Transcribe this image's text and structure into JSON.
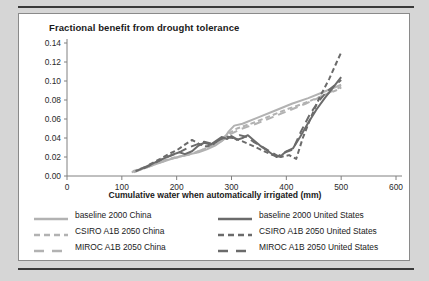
{
  "figure": {
    "title": "Fractional benefit from drought tolerance",
    "xlabel": "Cumulative water when automatically irrigated (mm)"
  },
  "colors": {
    "china": "#b2b2b2",
    "united_states": "#6b6b6b",
    "axis": "#808080",
    "text": "#1a1a1a",
    "page_background": "#d6d6d6",
    "card_background": "#ffffff",
    "rule": "#3a3a3a"
  },
  "legend": {
    "position": "below-axis",
    "items": [
      {
        "label": "baseline 2000 China",
        "color": "#b2b2b2",
        "style": "solid",
        "region": "China"
      },
      {
        "label": "baseline 2000 United States",
        "color": "#6b6b6b",
        "style": "solid",
        "region": "United States"
      },
      {
        "label": "CSIRO A1B 2050 China",
        "color": "#b2b2b2",
        "style": "dashed",
        "region": "China"
      },
      {
        "label": "CSIRO A1B 2050 United States",
        "color": "#6b6b6b",
        "style": "dashed",
        "region": "United States"
      },
      {
        "label": "MIROC A1B 2050 China",
        "color": "#b2b2b2",
        "style": "long-dash",
        "region": "China"
      },
      {
        "label": "MIROC A1B 2050 United States",
        "color": "#6b6b6b",
        "style": "long-dash",
        "region": "United States"
      }
    ]
  },
  "chart_data": {
    "type": "line",
    "title": "Fractional benefit from drought tolerance",
    "xlabel": "Cumulative water when automatically irrigated (mm)",
    "ylabel": "",
    "xlim": [
      0,
      600
    ],
    "ylim": [
      0.0,
      0.14
    ],
    "xticks": [
      0,
      100,
      200,
      300,
      400,
      500,
      600
    ],
    "yticks": [
      "0.00",
      "0.02",
      "0.04",
      "0.06",
      "0.08",
      "0.10",
      "0.12",
      "0.14"
    ],
    "grid": false,
    "legend_position": "bottom",
    "series": [
      {
        "name": "baseline 2000 China",
        "color": "#b2b2b2",
        "style": "solid",
        "points": [
          [
            118,
            0.004
          ],
          [
            135,
            0.007
          ],
          [
            150,
            0.01
          ],
          [
            165,
            0.013
          ],
          [
            180,
            0.016
          ],
          [
            195,
            0.019
          ],
          [
            210,
            0.021
          ],
          [
            225,
            0.023
          ],
          [
            240,
            0.025
          ],
          [
            255,
            0.028
          ],
          [
            270,
            0.032
          ],
          [
            285,
            0.038
          ],
          [
            295,
            0.047
          ],
          [
            305,
            0.053
          ],
          [
            320,
            0.055
          ],
          [
            350,
            0.062
          ],
          [
            380,
            0.069
          ],
          [
            410,
            0.076
          ],
          [
            440,
            0.082
          ],
          [
            470,
            0.089
          ],
          [
            500,
            0.096
          ]
        ]
      },
      {
        "name": "CSIRO A1B 2050 China",
        "color": "#b2b2b2",
        "style": "dashed",
        "points": [
          [
            120,
            0.005
          ],
          [
            140,
            0.009
          ],
          [
            160,
            0.013
          ],
          [
            180,
            0.017
          ],
          [
            200,
            0.02
          ],
          [
            220,
            0.022
          ],
          [
            240,
            0.026
          ],
          [
            260,
            0.031
          ],
          [
            280,
            0.038
          ],
          [
            295,
            0.045
          ],
          [
            310,
            0.05
          ],
          [
            340,
            0.056
          ],
          [
            370,
            0.063
          ],
          [
            400,
            0.07
          ],
          [
            430,
            0.076
          ],
          [
            460,
            0.083
          ],
          [
            490,
            0.09
          ],
          [
            500,
            0.093
          ]
        ]
      },
      {
        "name": "MIROC A1B 2050 China",
        "color": "#b2b2b2",
        "style": "long-dash",
        "points": [
          [
            122,
            0.004
          ],
          [
            145,
            0.009
          ],
          [
            168,
            0.014
          ],
          [
            190,
            0.018
          ],
          [
            212,
            0.021
          ],
          [
            235,
            0.025
          ],
          [
            258,
            0.03
          ],
          [
            280,
            0.036
          ],
          [
            298,
            0.044
          ],
          [
            315,
            0.049
          ],
          [
            345,
            0.055
          ],
          [
            375,
            0.062
          ],
          [
            405,
            0.069
          ],
          [
            435,
            0.076
          ],
          [
            465,
            0.084
          ],
          [
            500,
            0.094
          ]
        ]
      },
      {
        "name": "baseline 2000 United States",
        "color": "#6b6b6b",
        "style": "solid",
        "points": [
          [
            125,
            0.005
          ],
          [
            145,
            0.01
          ],
          [
            160,
            0.014
          ],
          [
            175,
            0.018
          ],
          [
            190,
            0.022
          ],
          [
            205,
            0.025
          ],
          [
            215,
            0.023
          ],
          [
            228,
            0.026
          ],
          [
            240,
            0.032
          ],
          [
            250,
            0.035
          ],
          [
            262,
            0.033
          ],
          [
            272,
            0.037
          ],
          [
            282,
            0.041
          ],
          [
            292,
            0.039
          ],
          [
            300,
            0.042
          ],
          [
            310,
            0.038
          ],
          [
            320,
            0.04
          ],
          [
            330,
            0.043
          ],
          [
            340,
            0.038
          ],
          [
            352,
            0.032
          ],
          [
            362,
            0.028
          ],
          [
            372,
            0.024
          ],
          [
            382,
            0.02
          ],
          [
            392,
            0.022
          ],
          [
            400,
            0.026
          ],
          [
            412,
            0.029
          ],
          [
            425,
            0.041
          ],
          [
            440,
            0.056
          ],
          [
            455,
            0.07
          ],
          [
            470,
            0.082
          ],
          [
            485,
            0.093
          ],
          [
            500,
            0.104
          ]
        ]
      },
      {
        "name": "CSIRO A1B 2050 United States",
        "color": "#6b6b6b",
        "style": "dashed",
        "points": [
          [
            150,
            0.012
          ],
          [
            170,
            0.018
          ],
          [
            185,
            0.023
          ],
          [
            200,
            0.027
          ],
          [
            215,
            0.033
          ],
          [
            228,
            0.038
          ],
          [
            240,
            0.034
          ],
          [
            255,
            0.031
          ],
          [
            268,
            0.034
          ],
          [
            280,
            0.039
          ],
          [
            292,
            0.041
          ],
          [
            305,
            0.04
          ],
          [
            318,
            0.037
          ],
          [
            330,
            0.034
          ],
          [
            345,
            0.03
          ],
          [
            360,
            0.026
          ],
          [
            375,
            0.022
          ],
          [
            390,
            0.02
          ],
          [
            405,
            0.022
          ],
          [
            418,
            0.018
          ],
          [
            430,
            0.04
          ],
          [
            445,
            0.062
          ],
          [
            460,
            0.082
          ],
          [
            478,
            0.102
          ],
          [
            492,
            0.12
          ],
          [
            500,
            0.13
          ]
        ]
      },
      {
        "name": "MIROC A1B 2050 United States",
        "color": "#6b6b6b",
        "style": "long-dash",
        "points": [
          [
            140,
            0.008
          ],
          [
            158,
            0.013
          ],
          [
            175,
            0.018
          ],
          [
            192,
            0.022
          ],
          [
            208,
            0.026
          ],
          [
            222,
            0.03
          ],
          [
            236,
            0.033
          ],
          [
            250,
            0.036
          ],
          [
            265,
            0.034
          ],
          [
            278,
            0.038
          ],
          [
            290,
            0.042
          ],
          [
            302,
            0.04
          ],
          [
            315,
            0.043
          ],
          [
            328,
            0.041
          ],
          [
            340,
            0.036
          ],
          [
            355,
            0.031
          ],
          [
            370,
            0.026
          ],
          [
            385,
            0.021
          ],
          [
            398,
            0.025
          ],
          [
            412,
            0.028
          ],
          [
            426,
            0.046
          ],
          [
            442,
            0.064
          ],
          [
            458,
            0.078
          ],
          [
            474,
            0.089
          ],
          [
            500,
            0.101
          ]
        ]
      }
    ]
  }
}
